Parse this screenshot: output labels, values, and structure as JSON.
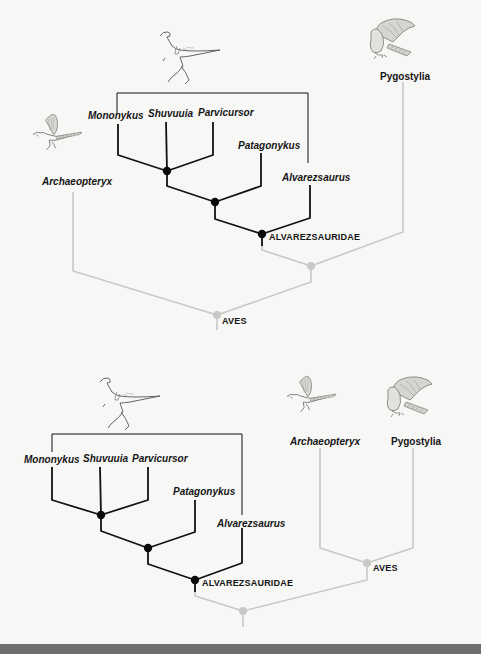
{
  "figure": {
    "colors": {
      "background": "#f7f7f5",
      "alvarezsaurid_branches": "#111111",
      "avian_branches": "#c8c8c8",
      "bottom_bar": "#6e6e6e"
    }
  },
  "top_tree": {
    "taxa": {
      "mononykus": "Mononykus",
      "shuvuuia": "Shuvuuia",
      "parvicursor": "Parvicursor",
      "patagonykus": "Patagonykus",
      "alvarezsaurus": "Alvarezsaurus",
      "archaeopteryx": "Archaeopteryx",
      "pygostylia": "Pygostylia"
    },
    "clades": {
      "alvarezsauridae": "ALVAREZSAURIDAE",
      "aves": "AVES"
    },
    "illustrations": [
      "alvarezsaurid-illustration",
      "archaeopteryx-illustration",
      "pygostylian-bird-illustration"
    ],
    "topology": "(Archaeopteryx, (Alvarezsauridae, Pygostylia)) = Aves"
  },
  "bottom_tree": {
    "taxa": {
      "mononykus": "Mononykus",
      "shuvuuia": "Shuvuuia",
      "parvicursor": "Parvicursor",
      "patagonykus": "Patagonykus",
      "alvarezsaurus": "Alvarezsaurus",
      "archaeopteryx": "Archaeopteryx",
      "pygostylia": "Pygostylia"
    },
    "clades": {
      "alvarezsauridae": "ALVAREZSAURIDAE",
      "aves": "AVES"
    },
    "illustrations": [
      "alvarezsaurid-illustration",
      "archaeopteryx-illustration",
      "pygostylian-bird-illustration"
    ],
    "topology": "(Alvarezsauridae, (Archaeopteryx, Pygostylia) = Aves)"
  }
}
